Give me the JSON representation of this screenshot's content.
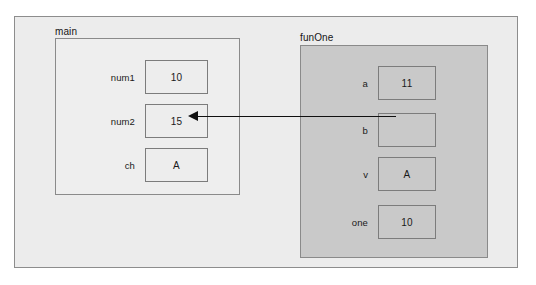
{
  "diagram": {
    "title": "",
    "colors": {
      "outer_frame_bg": "#ececec",
      "main_scope_bg": "#eeeeee",
      "funone_scope_bg": "#c9c9c9",
      "border": "#8a8a8a",
      "box_border": "#7c7c7c",
      "arrow": "#101010",
      "text": "#1a1a1a"
    },
    "scopes": [
      {
        "name": "main",
        "label": "main",
        "variables": [
          {
            "name": "num1",
            "label": "num1",
            "value": "10"
          },
          {
            "name": "num2",
            "label": "num2",
            "value": "15"
          },
          {
            "name": "ch",
            "label": "ch",
            "value": "A"
          }
        ]
      },
      {
        "name": "funOne",
        "label": "funOne",
        "variables": [
          {
            "name": "a",
            "label": "a",
            "value": "11"
          },
          {
            "name": "b",
            "label": "b",
            "value": ""
          },
          {
            "name": "v",
            "label": "v",
            "value": "A"
          },
          {
            "name": "one",
            "label": "one",
            "value": "10"
          }
        ]
      }
    ],
    "arrow": {
      "name": "reference-arrow-b-to-num2",
      "from": "funOne.b",
      "to": "main.num2",
      "direction": "left"
    }
  }
}
